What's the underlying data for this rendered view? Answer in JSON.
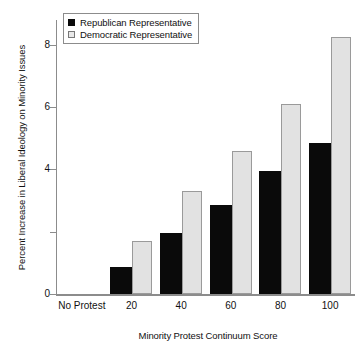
{
  "chart_data": {
    "type": "bar",
    "title": "",
    "xlabel": "Minority Protest Continuum Score",
    "ylabel": "Percent Increase in Liberal Ideology on Minority Issues",
    "categories": [
      "No Protest",
      "20",
      "40",
      "60",
      "80",
      "100"
    ],
    "series": [
      {
        "name": "Republican Representative",
        "color": "#0a0a0a",
        "values": [
          0,
          0.8,
          1.9,
          2.8,
          3.9,
          4.8
        ]
      },
      {
        "name": "Democratic Representative",
        "color": "#e2e2e2",
        "values": [
          0,
          1.7,
          3.3,
          4.6,
          6.1,
          8.25
        ]
      }
    ],
    "ylim": [
      0,
      8.8
    ],
    "yticks": [
      0,
      2,
      4,
      6,
      8
    ],
    "ytick_labels": [
      "0",
      "",
      "4",
      "6",
      "8"
    ],
    "ytick_labels_shown": [
      "0",
      "4",
      "6",
      "8"
    ],
    "grid": false,
    "legend_position": "top-left"
  },
  "legend": {
    "items": [
      {
        "label": "Republican Representative",
        "swatch": "filled-black-square"
      },
      {
        "label": "Democratic Representative",
        "swatch": "outlined-gray-square"
      }
    ]
  }
}
